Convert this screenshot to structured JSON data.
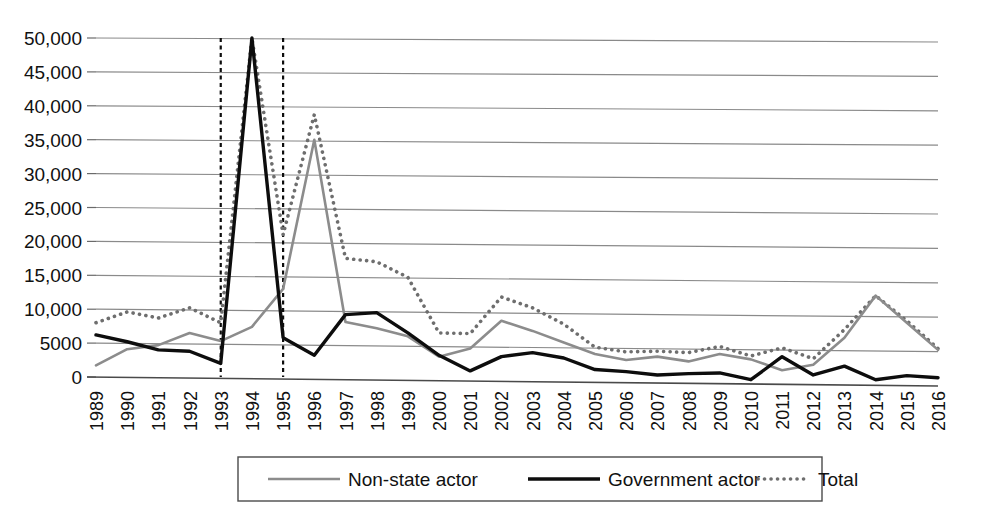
{
  "chart_data": {
    "type": "line",
    "title": "",
    "subtitle": "",
    "xlabel": "",
    "ylabel": "",
    "ylim": [
      0,
      50000
    ],
    "grid": true,
    "legend_position": "bottom",
    "y_ticks": [
      0,
      5000,
      10000,
      15000,
      20000,
      25000,
      30000,
      35000,
      40000,
      45000,
      50000
    ],
    "y_tick_labels": [
      "0",
      "5000",
      "10,000",
      "15,000",
      "20,000",
      "25,000",
      "30,000",
      "35,000",
      "40,000",
      "45,000",
      "50,000"
    ],
    "categories": [
      "1989",
      "1990",
      "1991",
      "1992",
      "1993",
      "1994",
      "1995",
      "1996",
      "1997",
      "1998",
      "1999",
      "2000",
      "2001",
      "2002",
      "2003",
      "2004",
      "2005",
      "2006",
      "2007",
      "2008",
      "2009",
      "2010",
      "2011",
      "2012",
      "2013",
      "2014",
      "2015",
      "2016"
    ],
    "series": [
      {
        "name": "Non-state actor",
        "color": "#8c8c8c",
        "style": "solid-gray",
        "values": [
          1700,
          4100,
          4700,
          6500,
          5300,
          7400,
          13000,
          35000,
          8100,
          7200,
          6000,
          3000,
          4200,
          8300,
          6800,
          5100,
          3400,
          2500,
          3000,
          2300,
          3400,
          2600,
          1000,
          1800,
          5800,
          12000,
          8000,
          4000
        ]
      },
      {
        "name": "Government actor",
        "color": "#0d0d0d",
        "style": "solid-black",
        "values": [
          6200,
          5200,
          4000,
          3800,
          2000,
          50000,
          5800,
          3200,
          9200,
          9500,
          6500,
          3200,
          900,
          3000,
          3600,
          2800,
          1100,
          800,
          300,
          500,
          600,
          -400,
          3000,
          300,
          1600,
          -400,
          200,
          -100
        ],
        "clipped_points": [
          {
            "category": "1993",
            "note": "off-scale spike above 50,000"
          },
          {
            "category": "1995",
            "note": "off-scale spike above 50,000"
          }
        ]
      },
      {
        "name": "Total",
        "color": "#6e6e6e",
        "style": "dotted",
        "values": [
          8000,
          9600,
          8700,
          10200,
          8000,
          50000,
          21000,
          38700,
          17500,
          17000,
          14700,
          6500,
          6400,
          11800,
          10200,
          7800,
          4400,
          3700,
          3800,
          3600,
          4500,
          3100,
          4300,
          2700,
          7000,
          12000,
          8300,
          4200
        ]
      }
    ],
    "vertical_markers": [
      {
        "category": "1993",
        "style": "dashed",
        "color": "#0d0d0d"
      },
      {
        "category": "1995",
        "style": "dashed",
        "color": "#0d0d0d"
      }
    ]
  }
}
